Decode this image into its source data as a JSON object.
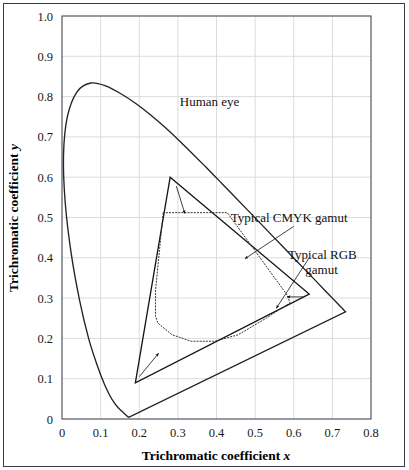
{
  "figure": {
    "title": "",
    "background_color": "#ffffff",
    "border_color": "#3a3a44"
  },
  "axes": {
    "x_title_text": "Trichromatic coefficient",
    "x_title_symbol": "x",
    "y_title_text": "Trichromatic coefficient",
    "y_title_symbol": "y",
    "x_ticks": [
      "0",
      "0.1",
      "0.2",
      "0.3",
      "0.4",
      "0.5",
      "0.6",
      "0.7",
      "0.8"
    ],
    "y_ticks": [
      "0",
      "0.1",
      "0.2",
      "0.3",
      "0.4",
      "0.5",
      "0.6",
      "0.7",
      "0.8",
      "0.9",
      "1.0"
    ],
    "grid_color": "#d8d8dc",
    "frame_color": "#555560"
  },
  "annotations": {
    "human_eye": "Human eye",
    "cmyk_gamut_line1": "Typical CMYK gamut",
    "rgb_gamut_line1": "Typical RGB",
    "rgb_gamut_line2": "gamut"
  },
  "chart_data": {
    "type": "line",
    "title": "",
    "xlabel": "Trichromatic coefficient x",
    "ylabel": "Trichromatic coefficient y",
    "xlim": [
      0,
      0.8
    ],
    "ylim": [
      0,
      1.0
    ],
    "grid": true,
    "legend_position": "inline-annotations",
    "series": [
      {
        "name": "Human eye",
        "style": "solid",
        "color": "#222222",
        "closed": true,
        "description": "CIE 1931 spectral locus (horseshoe) closed by the line of purples",
        "points": [
          [
            0.174,
            0.005
          ],
          [
            0.1738,
            0.0049
          ],
          [
            0.1736,
            0.0049
          ],
          [
            0.1733,
            0.0048
          ],
          [
            0.173,
            0.0048
          ],
          [
            0.1726,
            0.0048
          ],
          [
            0.1721,
            0.0048
          ],
          [
            0.1714,
            0.0051
          ],
          [
            0.1703,
            0.0058
          ],
          [
            0.1689,
            0.0069
          ],
          [
            0.1669,
            0.0086
          ],
          [
            0.1644,
            0.0109
          ],
          [
            0.1611,
            0.0138
          ],
          [
            0.1566,
            0.0177
          ],
          [
            0.151,
            0.0227
          ],
          [
            0.144,
            0.0297
          ],
          [
            0.1355,
            0.0399
          ],
          [
            0.1241,
            0.0578
          ],
          [
            0.1096,
            0.0868
          ],
          [
            0.0913,
            0.1327
          ],
          [
            0.0687,
            0.2007
          ],
          [
            0.0454,
            0.295
          ],
          [
            0.0235,
            0.4127
          ],
          [
            0.0082,
            0.5384
          ],
          [
            0.0039,
            0.6548
          ],
          [
            0.0139,
            0.7502
          ],
          [
            0.0389,
            0.812
          ],
          [
            0.0743,
            0.8338
          ],
          [
            0.1142,
            0.8262
          ],
          [
            0.1547,
            0.8059
          ],
          [
            0.1929,
            0.7816
          ],
          [
            0.2296,
            0.7543
          ],
          [
            0.2658,
            0.7243
          ],
          [
            0.3016,
            0.6923
          ],
          [
            0.3373,
            0.6589
          ],
          [
            0.3731,
            0.6245
          ],
          [
            0.4087,
            0.5896
          ],
          [
            0.4441,
            0.5547
          ],
          [
            0.4788,
            0.5202
          ],
          [
            0.5125,
            0.4866
          ],
          [
            0.5448,
            0.4544
          ],
          [
            0.5752,
            0.4242
          ],
          [
            0.6029,
            0.3965
          ],
          [
            0.627,
            0.3725
          ],
          [
            0.6482,
            0.3514
          ],
          [
            0.6658,
            0.334
          ],
          [
            0.6801,
            0.3197
          ],
          [
            0.6915,
            0.3083
          ],
          [
            0.7006,
            0.2993
          ],
          [
            0.7079,
            0.292
          ],
          [
            0.714,
            0.2859
          ],
          [
            0.719,
            0.2809
          ],
          [
            0.723,
            0.277
          ],
          [
            0.726,
            0.274
          ],
          [
            0.7283,
            0.2717
          ],
          [
            0.73,
            0.27
          ],
          [
            0.7311,
            0.2689
          ],
          [
            0.732,
            0.268
          ],
          [
            0.7327,
            0.2673
          ],
          [
            0.7334,
            0.2666
          ],
          [
            0.734,
            0.266
          ]
        ]
      },
      {
        "name": "Typical RGB gamut",
        "style": "solid",
        "color": "#141414",
        "closed": true,
        "description": "RGB primaries triangle",
        "points": [
          [
            0.28,
            0.6
          ],
          [
            0.64,
            0.31
          ],
          [
            0.19,
            0.09
          ]
        ]
      },
      {
        "name": "Typical CMYK gamut",
        "style": "dotted",
        "color": "#333333",
        "closed": true,
        "description": "CMYK printable gamut polygon",
        "points": [
          [
            0.262,
            0.512
          ],
          [
            0.428,
            0.512
          ],
          [
            0.584,
            0.306
          ],
          [
            0.59,
            0.288
          ],
          [
            0.525,
            0.248
          ],
          [
            0.456,
            0.209
          ],
          [
            0.396,
            0.193
          ],
          [
            0.334,
            0.193
          ],
          [
            0.285,
            0.209
          ],
          [
            0.248,
            0.238
          ],
          [
            0.242,
            0.256
          ],
          [
            0.242,
            0.318
          ]
        ]
      }
    ],
    "leaders": [
      {
        "name": "human-eye-leader",
        "label": "Human eye",
        "label_anchor": [
          0.3,
          0.785
        ],
        "target": null
      },
      {
        "name": "cmyk-leader",
        "label": "Typical CMYK gamut",
        "label_anchor": [
          0.6,
          0.478
        ],
        "target": [
          0.474,
          0.398
        ]
      },
      {
        "name": "rgb-leader",
        "label": "Typical RGB gamut",
        "label_anchor": [
          0.64,
          0.4
        ],
        "target": [
          0.555,
          0.275
        ]
      },
      {
        "name": "rgb-arrow-top",
        "label": "",
        "label_anchor": [
          0.296,
          0.578
        ],
        "target": [
          0.318,
          0.51
        ]
      },
      {
        "name": "rgb-arrow-right",
        "label": "",
        "label_anchor": [
          0.625,
          0.303
        ],
        "target": [
          0.583,
          0.303
        ]
      },
      {
        "name": "rgb-arrow-bottom",
        "label": "",
        "label_anchor": [
          0.2,
          0.105
        ],
        "target": [
          0.25,
          0.163
        ]
      }
    ]
  }
}
